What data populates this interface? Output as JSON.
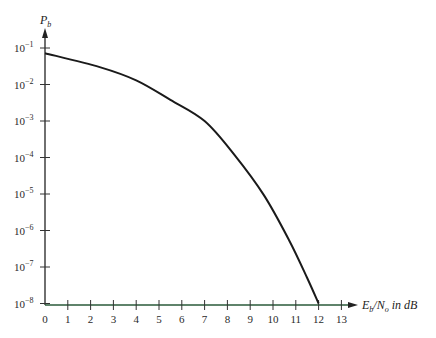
{
  "chart_data": {
    "type": "line",
    "title": "",
    "xlabel": "E_b/N_o in dB",
    "ylabel": "P_b",
    "yscale": "log",
    "xlim": [
      0,
      13
    ],
    "ylim": [
      1e-08,
      0.1
    ],
    "grid": false,
    "legend": null,
    "x_ticks": [
      0,
      1,
      2,
      3,
      4,
      5,
      6,
      7,
      8,
      9,
      10,
      11,
      12,
      13
    ],
    "y_ticks": [
      "10^-1",
      "10^-2",
      "10^-3",
      "10^-4",
      "10^-5",
      "10^-6",
      "10^-7",
      "10^-8"
    ],
    "series": [
      {
        "name": "P_b",
        "x": [
          0,
          2.4,
          4.0,
          5.5,
          7.0,
          8.3,
          9.6,
          10.7,
          11.5,
          12.0
        ],
        "y": [
          0.072,
          0.03,
          0.013,
          0.0038,
          0.001,
          0.00012,
          9.3e-06,
          5.5e-07,
          5e-08,
          1e-08
        ]
      }
    ]
  },
  "labels": {
    "y_axis_title_main": "P",
    "y_axis_title_sub": "b",
    "x_axis_title": "E_b/N_o in dB",
    "x_tick_labels": [
      "0",
      "1",
      "2",
      "3",
      "4",
      "5",
      "6",
      "7",
      "8",
      "9",
      "10",
      "11",
      "12",
      "13"
    ],
    "y_tick_exponents": [
      "−1",
      "−2",
      "−3",
      "−4",
      "−5",
      "−6",
      "−7",
      "−8"
    ]
  }
}
